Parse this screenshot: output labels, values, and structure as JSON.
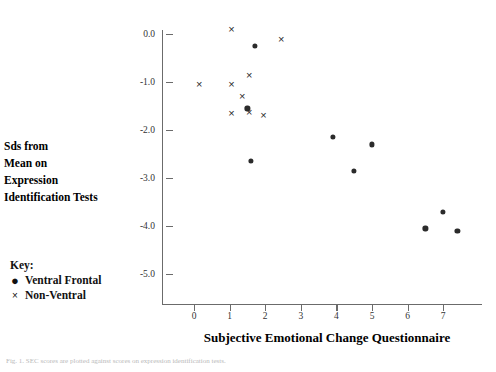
{
  "chart_data": {
    "type": "scatter",
    "title": "",
    "xlabel": "Subjective Emotional Change Questionnaire",
    "ylabel": "Sds from Mean on Expression Identification Tests",
    "ylabel_lines": [
      "Sds from",
      "Mean on",
      "Expression",
      "Identification Tests"
    ],
    "xlim": [
      -0.5,
      7.8
    ],
    "ylim": [
      -5.0,
      0.35
    ],
    "xticks": [
      0,
      1,
      2,
      3,
      4,
      5,
      6,
      7
    ],
    "xticklabels": [
      "0",
      "1",
      "2",
      "3",
      "4",
      "5",
      "6",
      "7"
    ],
    "yticks": [
      0.0,
      -1.0,
      -2.0,
      -3.0,
      -4.0,
      -5.0
    ],
    "yticklabels": [
      "0.0",
      "-1.0",
      "-2.0",
      "-3.0",
      "-4.0",
      "-5.0"
    ],
    "grid": false,
    "legend_position": "lower-left-outside",
    "legend_title": "Key:",
    "series": [
      {
        "name": "Ventral Frontal",
        "marker": "dot",
        "glyph": "●",
        "color": "#2b2b2b",
        "points": [
          {
            "x": 1.7,
            "y": -0.25
          },
          {
            "x": 1.5,
            "y": -1.55
          },
          {
            "x": 1.6,
            "y": -2.65
          },
          {
            "x": 3.9,
            "y": -2.15
          },
          {
            "x": 4.5,
            "y": -2.85
          },
          {
            "x": 5.0,
            "y": -2.3
          },
          {
            "x": 6.5,
            "y": -4.05
          },
          {
            "x": 7.0,
            "y": -3.7
          },
          {
            "x": 7.4,
            "y": -4.1
          }
        ]
      },
      {
        "name": "Non-Ventral",
        "marker": "cross",
        "glyph": "×",
        "color": "#2b2b2b",
        "points": [
          {
            "x": 1.05,
            "y": 0.1
          },
          {
            "x": 2.45,
            "y": -0.1
          },
          {
            "x": 1.55,
            "y": -0.85
          },
          {
            "x": 0.15,
            "y": -1.05
          },
          {
            "x": 1.05,
            "y": -1.05
          },
          {
            "x": 1.35,
            "y": -1.3
          },
          {
            "x": 1.05,
            "y": -1.65
          },
          {
            "x": 1.55,
            "y": -1.62
          },
          {
            "x": 1.95,
            "y": -1.68
          }
        ]
      }
    ]
  },
  "legend": {
    "title": "Key:",
    "entries": [
      {
        "glyph": "●",
        "label": "Ventral Frontal"
      },
      {
        "glyph": "×",
        "label": "Non-Ventral"
      }
    ]
  },
  "caption": "Fig. 1. SEC scores are plotted against scores on expression identification tests."
}
